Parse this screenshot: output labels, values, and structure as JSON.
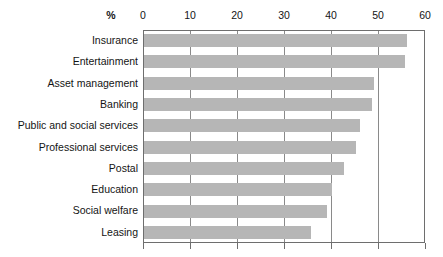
{
  "chart_data": {
    "type": "bar",
    "orientation": "horizontal",
    "title": "",
    "xlabel": "%",
    "ylabel": "",
    "xlim": [
      0,
      60
    ],
    "xticks": [
      0,
      10,
      20,
      30,
      40,
      50,
      60
    ],
    "xtick_labels": [
      "0",
      "10",
      "20",
      "30",
      "40",
      "50",
      "60"
    ],
    "grid": true,
    "legend": false,
    "bar_color": "#b6b6b6",
    "axis_color": "#6e6e6e",
    "categories": [
      "Insurance",
      "Entertainment",
      "Asset management",
      "Banking",
      "Public and social services",
      "Professional services",
      "Postal",
      "Education",
      "Social welfare",
      "Leasing"
    ],
    "values": [
      56,
      55.5,
      49,
      48.5,
      46,
      45,
      42.5,
      40,
      39,
      35.5
    ]
  },
  "axis": {
    "percent_symbol": "%"
  }
}
